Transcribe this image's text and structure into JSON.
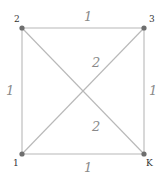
{
  "diagram": {
    "type": "weighted-graph",
    "colors": {
      "edge": "#b8b8b8",
      "node": "#6e6e6e",
      "node_label": "#333333",
      "weight_label": "#8a8a8a"
    },
    "nodes": [
      {
        "id": "2",
        "label": "2",
        "x": 22,
        "y": 28
      },
      {
        "id": "3",
        "label": "3",
        "x": 144,
        "y": 28
      },
      {
        "id": "1",
        "label": "1",
        "x": 22,
        "y": 154
      },
      {
        "id": "K",
        "label": "K",
        "x": 144,
        "y": 154
      }
    ],
    "edges": [
      {
        "from": "2",
        "to": "3",
        "weight": "1"
      },
      {
        "from": "2",
        "to": "1",
        "weight": "1"
      },
      {
        "from": "3",
        "to": "K",
        "weight": "1"
      },
      {
        "from": "1",
        "to": "K",
        "weight": "1"
      },
      {
        "from": "1",
        "to": "3",
        "weight": "2"
      },
      {
        "from": "2",
        "to": "K",
        "weight": "2"
      }
    ]
  }
}
